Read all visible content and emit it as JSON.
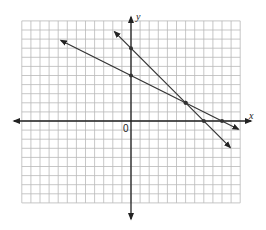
{
  "chart_data": {
    "type": "line",
    "title": "",
    "xlabel": "x",
    "ylabel": "y",
    "origin_label": "0",
    "grid": true,
    "xlim": [
      -12,
      12
    ],
    "ylim": [
      -9,
      11
    ],
    "series": [
      {
        "name": "line-1",
        "equation": "y = -x + 8",
        "marked_points": [
          [
            0,
            8
          ],
          [
            6,
            2
          ],
          [
            8,
            0
          ]
        ]
      },
      {
        "name": "line-2",
        "equation": "y = -x/2 + 5",
        "marked_points": [
          [
            0,
            5
          ],
          [
            6,
            2
          ],
          [
            10,
            0
          ]
        ]
      }
    ],
    "intersection": [
      6,
      2
    ]
  },
  "labels": {
    "x": "x",
    "y": "y",
    "origin": "0"
  },
  "colors": {
    "grid": "#b9b9b9",
    "axis": "#222222",
    "line": "#333333"
  }
}
